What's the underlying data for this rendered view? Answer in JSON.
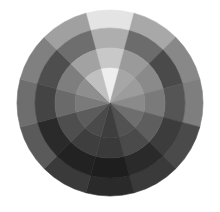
{
  "diagram": {
    "type": "grayscale-color-wheel",
    "center": [
      110,
      103
    ],
    "segments": 12,
    "start_angle_deg": -15,
    "rings": [
      {
        "name": "outer",
        "r_inner": 75,
        "r_outer": 93,
        "shades": [
          "#e4e4e4",
          "#a8a8a8",
          "#888888",
          "#7e7e7e",
          "#4a4a4a",
          "#3a3a3a",
          "#2a2a2a",
          "#3a3a3a",
          "#5a5a5a",
          "#6e6e6e",
          "#808080",
          "#a0a0a0"
        ]
      },
      {
        "name": "ring-2",
        "r_inner": 55,
        "r_outer": 75,
        "shades": [
          "#aeaeae",
          "#6c6c6c",
          "#4a4a4a",
          "#555555",
          "#3c3c3c",
          "#2a2a2a",
          "#1e1e1e",
          "#222222",
          "#2a2a2a",
          "#444444",
          "#4e4e4e",
          "#6e6e6e"
        ]
      },
      {
        "name": "ring-3",
        "r_inner": 35,
        "r_outer": 55,
        "shades": [
          "#c8c8c8",
          "#9a9a9a",
          "#8a8a8a",
          "#7a7a7a",
          "#5e5e5e",
          "#4a4a4a",
          "#3a3a3a",
          "#3e3e3e",
          "#4e4e4e",
          "#6a6a6a",
          "#7e7e7e",
          "#a2a2a2"
        ]
      },
      {
        "name": "core",
        "r_inner": 0,
        "r_outer": 35,
        "shades": [
          "#eeeeee",
          "#a6a6a6",
          "#9c9c9c",
          "#8a8a8a",
          "#6e6e6e",
          "#525252",
          "#3e3e3e",
          "#4a4a4a",
          "#5c5c5c",
          "#7a7a7a",
          "#8e8e8e",
          "#c0c0c0"
        ]
      }
    ]
  }
}
